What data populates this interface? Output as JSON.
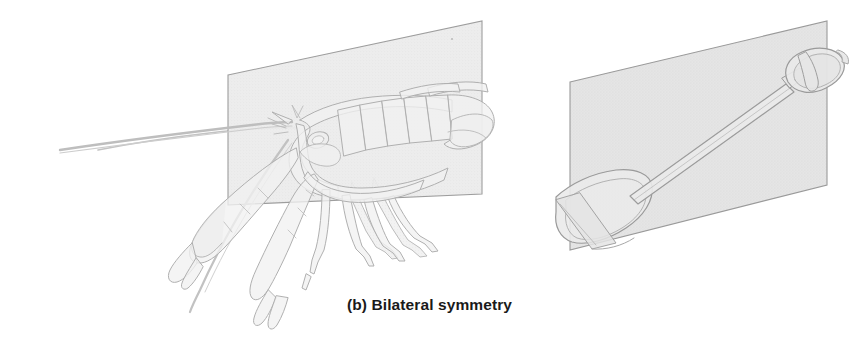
{
  "figure": {
    "caption": "(b) Bilateral symmetry",
    "background_color": "#ffffff",
    "panels": [
      {
        "name": "lobster-panel",
        "subject": "lobster",
        "plane_label": "sagittal plane",
        "plane_fill_color": "#e9e9e9",
        "plane_edge_color": "#9a9a9a",
        "outline_color": "#a9a9a9",
        "body_fill_color": "#efefef"
      },
      {
        "name": "shovel-panel",
        "subject": "shovel",
        "plane_label": "sagittal plane",
        "plane_fill_color": "#e0e0e0",
        "plane_edge_color": "#9a9a9a",
        "outline_color": "#9e9e9e",
        "body_fill_color": "#e6e6e6"
      }
    ]
  }
}
